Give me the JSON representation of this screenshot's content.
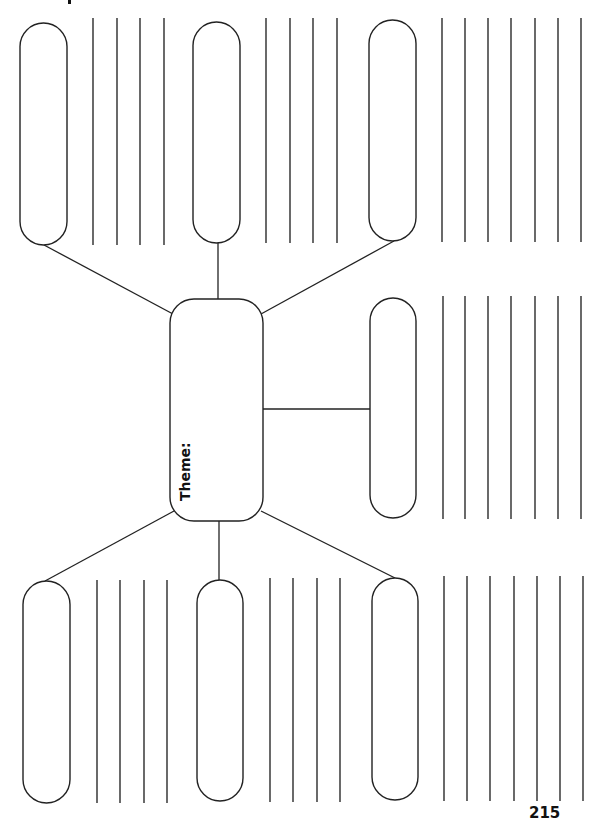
{
  "page": {
    "page_number": "215",
    "top_text_fragment": ""
  },
  "central_node": {
    "label": "Theme:",
    "box": {
      "x": 170,
      "y": 299,
      "w": 93,
      "h": 222,
      "r": 24
    }
  },
  "branch_nodes": [
    {
      "id": "top-left",
      "box": {
        "x": 20,
        "y": 23,
        "w": 47,
        "h": 222
      },
      "connector": [
        44,
        245,
        173,
        314
      ],
      "writing_lines_x": [
        93,
        117,
        140,
        164
      ],
      "lines_y": [
        18,
        245
      ]
    },
    {
      "id": "top-middle",
      "box": {
        "x": 193,
        "y": 22,
        "w": 47,
        "h": 221
      },
      "connector": [
        218,
        243,
        218,
        299
      ],
      "writing_lines_x": [
        266,
        290,
        313,
        337
      ],
      "lines_y": [
        18,
        243
      ]
    },
    {
      "id": "top-right",
      "box": {
        "x": 369,
        "y": 20,
        "w": 47,
        "h": 221
      },
      "connector": [
        394,
        241,
        261,
        314
      ],
      "writing_lines_x": [
        442,
        465,
        488,
        511,
        535,
        558,
        581
      ],
      "lines_y": [
        18,
        242
      ]
    },
    {
      "id": "middle-right",
      "box": {
        "x": 370,
        "y": 298,
        "w": 46,
        "h": 220
      },
      "connector": [
        263,
        409,
        370,
        409
      ],
      "writing_lines_x": [
        443,
        465,
        488,
        511,
        535,
        558,
        581
      ],
      "lines_y": [
        296,
        519
      ]
    },
    {
      "id": "bottom-left",
      "box": {
        "x": 23,
        "y": 581,
        "w": 47,
        "h": 222
      },
      "connector": [
        174,
        511,
        45,
        581
      ],
      "writing_lines_x": [
        97,
        120,
        144,
        167
      ],
      "lines_y": [
        580,
        803
      ]
    },
    {
      "id": "bottom-middle",
      "box": {
        "x": 197,
        "y": 580,
        "w": 46,
        "h": 221
      },
      "connector": [
        219,
        521,
        219,
        580
      ],
      "writing_lines_x": [
        270,
        293,
        317,
        340
      ],
      "lines_y": [
        578,
        802
      ]
    },
    {
      "id": "bottom-right",
      "box": {
        "x": 372,
        "y": 578,
        "w": 46,
        "h": 222
      },
      "connector": [
        261,
        511,
        395,
        578
      ],
      "writing_lines_x": [
        444,
        467,
        490,
        514,
        537,
        560,
        583
      ],
      "lines_y": [
        576,
        801
      ]
    }
  ],
  "colors": {
    "stroke": "#222222",
    "background": "#ffffff"
  }
}
